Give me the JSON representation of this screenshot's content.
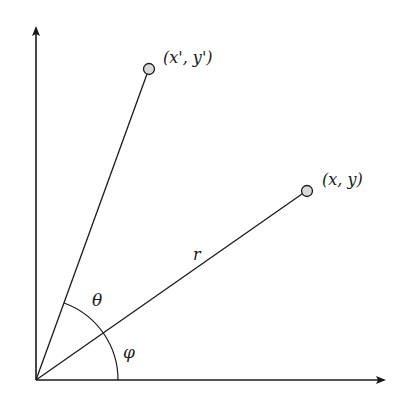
{
  "diagram": {
    "colors": {
      "stroke": "#1a1a1a",
      "point_fill": "#d9d9d9",
      "background": "#ffffff"
    },
    "origin": {
      "x": 36,
      "y": 380
    },
    "axes": {
      "x_axis": {
        "from": [
          36,
          380
        ],
        "to": [
          384,
          380
        ],
        "arrow": true
      },
      "y_axis": {
        "from": [
          36,
          380
        ],
        "to": [
          36,
          28
        ],
        "arrow": true
      }
    },
    "points": [
      {
        "id": "original",
        "label": "(x, y)",
        "cx": 307,
        "cy": 191
      },
      {
        "id": "rotated",
        "label": "(x', y')",
        "cx": 149,
        "cy": 69
      }
    ],
    "labels": {
      "radius": "r",
      "rotation_angle": "θ",
      "initial_angle": "φ"
    }
  }
}
